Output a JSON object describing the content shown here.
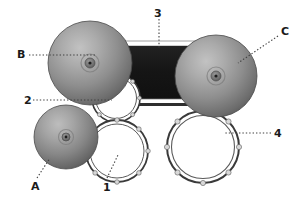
{
  "diagram": {
    "title": "",
    "background_color": "#ffffff",
    "canvas": {
      "width": 299,
      "height": 201
    },
    "palette": {
      "sphere_light": "#b5b5b5",
      "sphere_mid": "#8f8f8f",
      "sphere_dark": "#5a5a5a",
      "sphere_edge": "#4a4a4a",
      "hub_dark": "#2b2b2b",
      "block_dark": "#1a1a1a",
      "block_rim": "#ffffff",
      "block_rim_shadow": "#6e6e6e",
      "ring_stroke": "#3a3a3a",
      "ring_fill": "#ffffff",
      "lug_fill": "#d8d8d8",
      "leader_line": "#404040",
      "label_text": "#1a1a1a"
    },
    "spheres": [
      {
        "name": "sphere-b",
        "cx": 90,
        "cy": 63,
        "r": 42,
        "hub_r": 5,
        "pupil_r": 1.6
      },
      {
        "name": "sphere-c",
        "cx": 216,
        "cy": 76,
        "r": 41,
        "hub_r": 5,
        "pupil_r": 1.6
      },
      {
        "name": "sphere-a",
        "cx": 66,
        "cy": 137,
        "r": 32,
        "hub_r": 4,
        "pupil_r": 1.4
      }
    ],
    "rings": [
      {
        "name": "ring-2",
        "cx": 116,
        "cy": 98,
        "r": 24,
        "lugs": 8
      },
      {
        "name": "ring-1",
        "cx": 117,
        "cy": 151,
        "r": 31,
        "lugs": 8
      },
      {
        "name": "ring-4",
        "cx": 203,
        "cy": 147,
        "r": 36,
        "lugs": 8
      }
    ],
    "block": {
      "name": "dark-block",
      "x": 106,
      "y": 45,
      "width": 106,
      "height": 59,
      "rim_thickness": 4
    },
    "callouts": [
      {
        "id": "B",
        "label": "B",
        "label_x": 17,
        "label_y": 49,
        "leader": {
          "x1": 29,
          "y1": 55,
          "x2": 97,
          "y2": 55
        },
        "points_to": "sphere-b",
        "style": "dotted-horizontal"
      },
      {
        "id": "3",
        "label": "3",
        "label_x": 154,
        "label_y": 8,
        "leader": {
          "x1": 159,
          "y1": 19,
          "x2": 159,
          "y2": 48
        },
        "points_to": "dark-block",
        "style": "dotted-vertical"
      },
      {
        "id": "C",
        "label": "C",
        "label_x": 281,
        "label_y": 26,
        "leader": {
          "x1": 278,
          "y1": 36,
          "x2": 238,
          "y2": 63
        },
        "points_to": "sphere-c",
        "style": "dotted-diagonal"
      },
      {
        "id": "2",
        "label": "2",
        "label_x": 24,
        "label_y": 95,
        "leader": {
          "x1": 33,
          "y1": 100,
          "x2": 112,
          "y2": 100
        },
        "points_to": "ring-2",
        "style": "dotted-horizontal"
      },
      {
        "id": "4",
        "label": "4",
        "label_x": 274,
        "label_y": 128,
        "leader": {
          "x1": 271,
          "y1": 133,
          "x2": 225,
          "y2": 133
        },
        "points_to": "ring-4",
        "style": "dotted-horizontal"
      },
      {
        "id": "A",
        "label": "A",
        "label_x": 31,
        "label_y": 181,
        "leader": {
          "x1": 37,
          "y1": 178,
          "x2": 50,
          "y2": 158
        },
        "points_to": "sphere-a",
        "style": "dotted-diagonal"
      },
      {
        "id": "1",
        "label": "1",
        "label_x": 103,
        "label_y": 182,
        "leader": {
          "x1": 107,
          "y1": 178,
          "x2": 118,
          "y2": 155
        },
        "points_to": "ring-1",
        "style": "dotted-diagonal"
      }
    ]
  }
}
